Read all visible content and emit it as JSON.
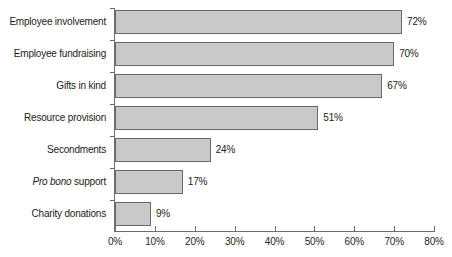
{
  "chart_data": {
    "type": "bar",
    "orientation": "horizontal",
    "title": "",
    "subtitle": "",
    "xlabel": "",
    "ylabel": "",
    "xlim": [
      0,
      80
    ],
    "grid": false,
    "legend": null,
    "categories": [
      "Employee involvement",
      "Employee fundraising",
      "Gifts in kind",
      "Resource provision",
      "Secondments",
      "Pro bono support",
      "Charity donations"
    ],
    "values": [
      72,
      70,
      67,
      51,
      24,
      17,
      9
    ],
    "data_labels": [
      "72%",
      "70%",
      "67%",
      "51%",
      "24%",
      "17%",
      "9%"
    ],
    "xticks": [
      0,
      10,
      20,
      30,
      40,
      50,
      60,
      70,
      80
    ],
    "xtick_labels": [
      "0%",
      "10%",
      "20%",
      "30%",
      "40%",
      "50%",
      "60%",
      "70%",
      "80%"
    ],
    "bar_fill_color": "#c9c9c9",
    "bar_edge_color": "#6a6a6a",
    "axis_color": "#6d6d6d",
    "text_color": "#1c1c1c"
  },
  "category_labels": [
    {
      "plain": "Employee involvement",
      "italic_prefix": "",
      "rest": "Employee involvement"
    },
    {
      "plain": "Employee fundraising",
      "italic_prefix": "",
      "rest": "Employee fundraising"
    },
    {
      "plain": "Gifts in kind",
      "italic_prefix": "",
      "rest": "Gifts in kind"
    },
    {
      "plain": "Resource provision",
      "italic_prefix": "",
      "rest": "Resource provision"
    },
    {
      "plain": "Secondments",
      "italic_prefix": "",
      "rest": "Secondments"
    },
    {
      "plain": "Pro bono support",
      "italic_prefix": "Pro bono",
      "rest": " support"
    },
    {
      "plain": "Charity donations",
      "italic_prefix": "",
      "rest": "Charity donations"
    }
  ]
}
